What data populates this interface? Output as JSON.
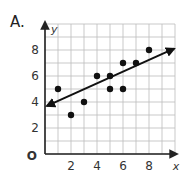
{
  "problem": {
    "label": "A."
  },
  "chart_data": {
    "type": "scatter",
    "title": "",
    "xlabel": "x",
    "ylabel": "y",
    "origin_label": "O",
    "xlim": [
      0,
      10
    ],
    "ylim": [
      0,
      10
    ],
    "x_ticks": [
      2,
      4,
      6,
      8
    ],
    "y_ticks": [
      2,
      4,
      6,
      8
    ],
    "grid": true,
    "points": [
      {
        "x": 1,
        "y": 5
      },
      {
        "x": 2,
        "y": 3
      },
      {
        "x": 3,
        "y": 4
      },
      {
        "x": 4,
        "y": 6
      },
      {
        "x": 5,
        "y": 6
      },
      {
        "x": 5,
        "y": 5
      },
      {
        "x": 6,
        "y": 7
      },
      {
        "x": 6,
        "y": 5
      },
      {
        "x": 7,
        "y": 7
      },
      {
        "x": 8,
        "y": 8
      }
    ],
    "trend_line": {
      "x1": 0,
      "y1": 3.7,
      "x2": 10,
      "y2": 8.1,
      "arrows": "both"
    },
    "colors": {
      "grid": "#bbbbbb",
      "axis": "#222222",
      "points": "#111111",
      "line": "#111111"
    }
  }
}
